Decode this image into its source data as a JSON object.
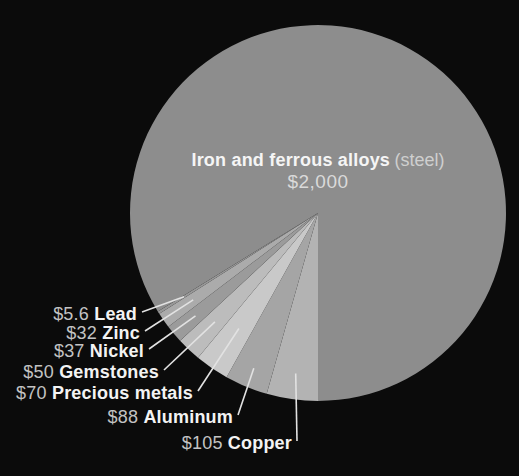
{
  "background_color": "#0b0b0b",
  "chart_data": {
    "type": "pie",
    "title": "",
    "unit": "$",
    "total": 2387.6,
    "legend_position": "callouts-lower-left",
    "geometry": {
      "cx": 318,
      "cy": 213,
      "r": 188,
      "start_angle_deg": 180,
      "direction": "clockwise"
    },
    "center_label": {
      "bold": "Iron and ferrous alloys",
      "note": "(steel)",
      "value": "$2,000"
    },
    "slices": [
      {
        "id": "copper",
        "name": "Copper",
        "display_value": "$105",
        "value": 105,
        "color": "#b3b3b3"
      },
      {
        "id": "aluminum",
        "name": "Aluminum",
        "display_value": "$88",
        "value": 88,
        "color": "#a5a5a5"
      },
      {
        "id": "precious-metals",
        "name": "Precious metals",
        "display_value": "$70",
        "value": 70,
        "color": "#c9c9c9"
      },
      {
        "id": "gemstones",
        "name": "Gemstones",
        "display_value": "$50",
        "value": 50,
        "color": "#bcbcbc"
      },
      {
        "id": "nickel",
        "name": "Nickel",
        "display_value": "$37",
        "value": 37,
        "color": "#9b9b9b"
      },
      {
        "id": "zinc",
        "name": "Zinc",
        "display_value": "$32",
        "value": 32,
        "color": "#ababab"
      },
      {
        "id": "lead",
        "name": "Lead",
        "display_value": "$5.6",
        "value": 5.6,
        "color": "#989898"
      },
      {
        "id": "steel",
        "name": "Iron and ferrous alloys (steel)",
        "display_value": "$2,000",
        "value": 2000,
        "color": "#8d8d8d"
      }
    ],
    "callouts": [
      {
        "slice": "lead",
        "text_value": "$5.6",
        "text_name": "Lead",
        "right_x": 137,
        "center_y": 314,
        "line_r": 158
      },
      {
        "slice": "zinc",
        "text_value": "$32",
        "text_name": "Zinc",
        "right_x": 140,
        "center_y": 333,
        "line_r": 152
      },
      {
        "slice": "nickel",
        "text_value": "$37",
        "text_name": "Nickel",
        "right_x": 144,
        "center_y": 351,
        "line_r": 160
      },
      {
        "slice": "gemstones",
        "text_value": "$50",
        "text_name": "Gemstones",
        "right_x": 159,
        "center_y": 372,
        "line_r": 150
      },
      {
        "slice": "precious-metals",
        "text_value": "$70",
        "text_name": "Precious metals",
        "right_x": 193,
        "center_y": 393,
        "line_r": 140
      },
      {
        "slice": "aluminum",
        "text_value": "$88",
        "text_name": "Aluminum",
        "right_x": 233,
        "center_y": 417,
        "line_r": 168
      },
      {
        "slice": "copper",
        "text_value": "$105",
        "text_name": "Copper",
        "right_x": 292,
        "center_y": 443,
        "line_r": 162
      }
    ],
    "leader_line_color": "#e2e2e2"
  }
}
